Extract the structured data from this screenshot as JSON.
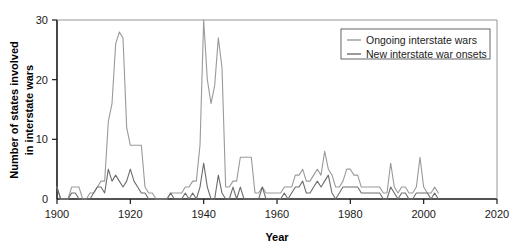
{
  "chart_data": {
    "type": "line",
    "title": "",
    "xlabel": "Year",
    "ylabel": "Number of states involved in interstate wars",
    "ylabel_line1": "Number of states involved",
    "ylabel_line2": "in interstate wars",
    "xlim": [
      1900,
      2020
    ],
    "ylim": [
      0,
      30
    ],
    "xticks": [
      1900,
      1920,
      1940,
      1960,
      1980,
      2000,
      2020
    ],
    "xtick_labels": [
      "1900",
      "1920",
      "1940",
      "1960",
      "1980",
      "2000",
      "2020"
    ],
    "yticks": [
      0,
      10,
      20,
      30
    ],
    "ytick_labels": [
      "0",
      "10",
      "20",
      "30"
    ],
    "grid": false,
    "legend_position": "top-right",
    "colors": {
      "ongoing": "#9a9a9a",
      "onsets": "#6d6d6d",
      "axis": "#1a1a1a",
      "legend_border": "#555555",
      "background": "#ffffff"
    },
    "x": [
      1900,
      1901,
      1902,
      1903,
      1904,
      1905,
      1906,
      1907,
      1908,
      1909,
      1910,
      1911,
      1912,
      1913,
      1914,
      1915,
      1916,
      1917,
      1918,
      1919,
      1920,
      1921,
      1922,
      1923,
      1924,
      1925,
      1926,
      1927,
      1928,
      1929,
      1930,
      1931,
      1932,
      1933,
      1934,
      1935,
      1936,
      1937,
      1938,
      1939,
      1940,
      1941,
      1942,
      1943,
      1944,
      1945,
      1946,
      1947,
      1948,
      1949,
      1950,
      1951,
      1952,
      1953,
      1954,
      1955,
      1956,
      1957,
      1958,
      1959,
      1960,
      1961,
      1962,
      1963,
      1964,
      1965,
      1966,
      1967,
      1968,
      1969,
      1970,
      1971,
      1972,
      1973,
      1974,
      1975,
      1976,
      1977,
      1978,
      1979,
      1980,
      1981,
      1982,
      1983,
      1984,
      1985,
      1986,
      1987,
      1988,
      1989,
      1990,
      1991,
      1992,
      1993,
      1994,
      1995,
      1996,
      1997,
      1998,
      1999,
      2000,
      2001,
      2002,
      2003,
      2004
    ],
    "series": [
      {
        "name": "Ongoing interstate wars",
        "key": "ongoing",
        "color": "#9a9a9a",
        "values": [
          2,
          0,
          0,
          0,
          2,
          2,
          2,
          0,
          0,
          1,
          1,
          2,
          3,
          3,
          13,
          16,
          26,
          28,
          27,
          12,
          9,
          9,
          9,
          9,
          2,
          1,
          1,
          0,
          0,
          0,
          0,
          1,
          1,
          1,
          1,
          2,
          2,
          3,
          3,
          9,
          30,
          20,
          16,
          19,
          27,
          22,
          2,
          2,
          3,
          3,
          7,
          7,
          7,
          7,
          1,
          1,
          2,
          1,
          1,
          1,
          1,
          1,
          2,
          2,
          2,
          4,
          4,
          5,
          3,
          3,
          4,
          5,
          4,
          8,
          5,
          4,
          2,
          2,
          3,
          5,
          5,
          4,
          4,
          2,
          2,
          2,
          2,
          2,
          2,
          1,
          1,
          6,
          2,
          1,
          2,
          2,
          1,
          1,
          2,
          7,
          2,
          1,
          1,
          2,
          1
        ]
      },
      {
        "name": "New interstate war onsets",
        "key": "onsets",
        "color": "#6d6d6d",
        "values": [
          2,
          0,
          0,
          0,
          1,
          1,
          0,
          0,
          0,
          0,
          1,
          2,
          2,
          1,
          5,
          3,
          4,
          3,
          2,
          3,
          5,
          3,
          2,
          1,
          1,
          0,
          0,
          0,
          0,
          0,
          0,
          1,
          0,
          0,
          0,
          1,
          0,
          1,
          0,
          2,
          6,
          2,
          0,
          0,
          4,
          1,
          0,
          0,
          2,
          0,
          2,
          0,
          0,
          0,
          0,
          0,
          2,
          0,
          0,
          0,
          0,
          0,
          1,
          0,
          1,
          2,
          2,
          3,
          1,
          1,
          2,
          3,
          2,
          3,
          4,
          1,
          0,
          1,
          2,
          2,
          2,
          2,
          2,
          1,
          1,
          1,
          1,
          1,
          1,
          0,
          0,
          2,
          1,
          0,
          1,
          1,
          0,
          0,
          1,
          1,
          1,
          1,
          0,
          1,
          0
        ]
      }
    ],
    "legend": [
      {
        "label": "Ongoing interstate wars",
        "color": "#9a9a9a"
      },
      {
        "label": "New interstate war onsets",
        "color": "#6d6d6d"
      }
    ]
  }
}
